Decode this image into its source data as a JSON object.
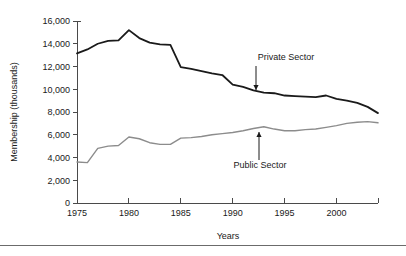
{
  "chart_data": {
    "type": "line",
    "title": "",
    "xlabel": "Years",
    "ylabel": "Membership (thousands)",
    "xlim": [
      1975,
      2004
    ],
    "ylim": [
      0,
      16000
    ],
    "grid": false,
    "legend_position": "inline-annotations",
    "x_ticks": [
      1975,
      1980,
      1985,
      1990,
      1995,
      2000
    ],
    "x_tick_labels": [
      "1975",
      "1980",
      "1985",
      "1990",
      "1995",
      "2000"
    ],
    "y_ticks": [
      0,
      2000,
      4000,
      6000,
      8000,
      10000,
      12000,
      14000,
      16000
    ],
    "y_tick_labels": [
      "0",
      "2,000",
      "4,000",
      "6,000",
      "8,000",
      "10,000",
      "12,000",
      "14,000",
      "16,000"
    ],
    "x": [
      1975,
      1976,
      1977,
      1978,
      1979,
      1980,
      1981,
      1982,
      1983,
      1984,
      1985,
      1986,
      1987,
      1988,
      1989,
      1990,
      1991,
      1992,
      1993,
      1994,
      1995,
      1996,
      1997,
      1998,
      1999,
      2000,
      2001,
      2002,
      2003,
      2004
    ],
    "series": [
      {
        "name": "Private Sector",
        "color": "#1a1a1a",
        "width": 1.8,
        "values": [
          13150,
          13500,
          14000,
          14250,
          14300,
          15200,
          14500,
          14100,
          13950,
          13900,
          11950,
          11800,
          11600,
          11400,
          11250,
          10400,
          10200,
          9900,
          9700,
          9650,
          9450,
          9400,
          9350,
          9300,
          9450,
          9150,
          9000,
          8800,
          8450,
          7900
        ]
      },
      {
        "name": "Public Sector",
        "color": "#8c8c8c",
        "width": 1.4,
        "values": [
          3600,
          3550,
          4800,
          5000,
          5050,
          5800,
          5650,
          5300,
          5150,
          5150,
          5700,
          5750,
          5850,
          6000,
          6100,
          6200,
          6350,
          6550,
          6700,
          6500,
          6350,
          6350,
          6450,
          6500,
          6650,
          6800,
          7000,
          7100,
          7150,
          7050
        ]
      }
    ],
    "annotations": [
      {
        "name": "private-sector-annotation",
        "text": "Private Sector",
        "label_x": 286,
        "label_y": 60,
        "arrow_from_x": 256,
        "arrow_from_y": 66,
        "arrow_to_x": 256,
        "arrow_to_y": 90,
        "direction": "down"
      },
      {
        "name": "public-sector-annotation",
        "text": "Public Sector",
        "label_x": 260,
        "label_y": 168,
        "arrow_from_x": 259,
        "arrow_from_y": 160,
        "arrow_to_x": 259,
        "arrow_to_y": 132,
        "direction": "up"
      }
    ]
  },
  "plot": {
    "left": 77,
    "right": 378,
    "top": 21,
    "bottom": 203
  },
  "footer": {
    "rule_y": 245
  }
}
